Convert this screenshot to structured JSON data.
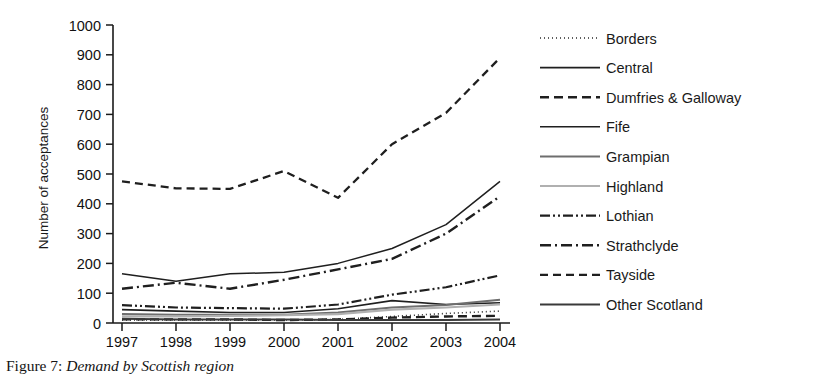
{
  "figure": {
    "caption_prefix": "Figure 7:",
    "caption_title": "Demand by Scottish region"
  },
  "chart_data": {
    "type": "line",
    "title": "",
    "xlabel": "",
    "ylabel": "Number of acceptances",
    "x": [
      "1997",
      "1998",
      "1999",
      "2000",
      "2001",
      "2002",
      "2003",
      "2004"
    ],
    "xlim": [
      "1997",
      "2004"
    ],
    "ylim": [
      0,
      1000
    ],
    "yticks": [
      0,
      100,
      200,
      300,
      400,
      500,
      600,
      700,
      800,
      900,
      1000
    ],
    "ytick_labels": [
      "0",
      "100",
      "200",
      "300",
      "400",
      "500",
      "600",
      "700",
      "800",
      "900",
      "1000"
    ],
    "grid": false,
    "legend_position": "right",
    "series": [
      {
        "name": "Borders",
        "style": "dotted",
        "color": "#2b2b2b",
        "width": 1.6,
        "dash": "1,3",
        "values": [
          10,
          10,
          10,
          10,
          12,
          22,
          32,
          40
        ]
      },
      {
        "name": "Central",
        "style": "solid",
        "color": "#1f1f1f",
        "width": 1.6,
        "dash": "",
        "values": [
          45,
          40,
          35,
          35,
          48,
          75,
          62,
          68
        ]
      },
      {
        "name": "Dumfries & Galloway",
        "style": "dashed",
        "color": "#1f1f1f",
        "width": 2.4,
        "dash": "9,5",
        "values": [
          12,
          12,
          12,
          10,
          12,
          18,
          22,
          24
        ]
      },
      {
        "name": "Fife",
        "style": "solid",
        "color": "#1f1f1f",
        "width": 1.5,
        "dash": "",
        "values": [
          165,
          140,
          165,
          170,
          200,
          250,
          330,
          475
        ]
      },
      {
        "name": "Grampian",
        "style": "solid",
        "color": "#6e6e6e",
        "width": 2.0,
        "dash": "",
        "values": [
          30,
          28,
          28,
          28,
          35,
          52,
          60,
          78
        ]
      },
      {
        "name": "Highland",
        "style": "solid",
        "color": "#b0b0b0",
        "width": 2.2,
        "dash": "",
        "values": [
          22,
          22,
          24,
          26,
          30,
          45,
          52,
          62
        ]
      },
      {
        "name": "Lothian",
        "style": "dash-dot-dot",
        "color": "#1f1f1f",
        "width": 2.2,
        "dash": "10,3,2,3,2,3",
        "values": [
          60,
          52,
          50,
          48,
          62,
          95,
          120,
          160
        ]
      },
      {
        "name": "Strathclyde",
        "style": "dash-dot",
        "color": "#1f1f1f",
        "width": 2.4,
        "dash": "11,4,2,4",
        "values": [
          115,
          135,
          115,
          145,
          180,
          215,
          300,
          425
        ]
      },
      {
        "name": "Tayside",
        "style": "dashed",
        "color": "#1f1f1f",
        "width": 2.3,
        "dash": "8,5",
        "values": [
          475,
          452,
          450,
          510,
          420,
          600,
          705,
          890
        ]
      },
      {
        "name": "Other Scotland",
        "style": "solid",
        "color": "#3a3a3a",
        "width": 2.0,
        "dash": "",
        "values": [
          14,
          12,
          12,
          12,
          10,
          10,
          10,
          12
        ]
      }
    ]
  },
  "legend": {
    "items": [
      {
        "label": "Borders"
      },
      {
        "label": "Central"
      },
      {
        "label": "Dumfries & Galloway"
      },
      {
        "label": "Fife"
      },
      {
        "label": "Grampian"
      },
      {
        "label": "Highland"
      },
      {
        "label": "Lothian"
      },
      {
        "label": "Strathclyde"
      },
      {
        "label": "Tayside"
      },
      {
        "label": "Other Scotland"
      }
    ]
  }
}
